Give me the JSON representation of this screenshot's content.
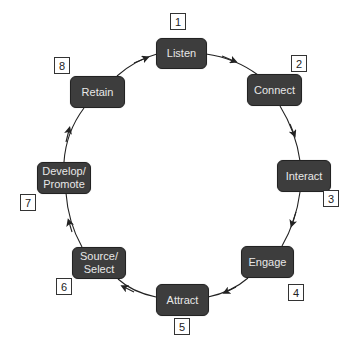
{
  "diagram": {
    "type": "cycle",
    "colors": {
      "node_fill": "#3d3d3d",
      "node_text": "#e8e8e8",
      "arrow": "#222222",
      "badge_border": "#333333"
    },
    "steps": [
      {
        "number": "1",
        "label": "Listen"
      },
      {
        "number": "2",
        "label": "Connect"
      },
      {
        "number": "3",
        "label": "Interact"
      },
      {
        "number": "4",
        "label": "Engage"
      },
      {
        "number": "5",
        "label": "Attract"
      },
      {
        "number": "6",
        "label": "Source/ Select"
      },
      {
        "number": "7",
        "label": "Develop/ Promote"
      },
      {
        "number": "8",
        "label": "Retain"
      }
    ],
    "direction": "clockwise"
  }
}
